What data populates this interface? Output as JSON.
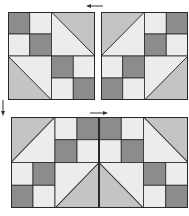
{
  "diagram": {
    "title": "",
    "colors": {
      "dark": "#8c8c8c",
      "medium": "#c4c4c4",
      "light": "#ececec",
      "outline": "#2a2a2a",
      "arrow": "#333333"
    },
    "blocks": [
      {
        "id": "block-a",
        "position": "top-left",
        "quadrants": {
          "tl": {
            "type": "four-patch",
            "cells": [
              "dark",
              "light",
              "light",
              "dark"
            ]
          },
          "tr": {
            "type": "hst",
            "diagonal": "tl-br",
            "upper": "medium",
            "lower": "light"
          },
          "bl": {
            "type": "hst",
            "diagonal": "tl-br",
            "upper": "light",
            "lower": "medium"
          },
          "br": {
            "type": "four-patch",
            "cells": [
              "dark",
              "light",
              "light",
              "dark"
            ]
          }
        }
      },
      {
        "id": "block-b",
        "position": "top-right",
        "quadrants": {
          "tl": {
            "type": "hst",
            "diagonal": "bl-tr",
            "upper": "medium",
            "lower": "light"
          },
          "tr": {
            "type": "four-patch",
            "cells": [
              "light",
              "dark",
              "dark",
              "light"
            ]
          },
          "bl": {
            "type": "four-patch",
            "cells": [
              "light",
              "dark",
              "dark",
              "light"
            ]
          },
          "br": {
            "type": "hst",
            "diagonal": "bl-tr",
            "upper": "light",
            "lower": "medium"
          }
        }
      }
    ],
    "assembled_row": {
      "position": "bottom",
      "order": [
        "block-b",
        "block-a"
      ]
    },
    "arrows": [
      {
        "id": "arrow-top",
        "direction": "left",
        "location": "above gap between top blocks"
      },
      {
        "id": "arrow-left",
        "direction": "down",
        "location": "left side between rows"
      },
      {
        "id": "arrow-bottom",
        "direction": "right",
        "location": "above assembled row"
      }
    ]
  }
}
